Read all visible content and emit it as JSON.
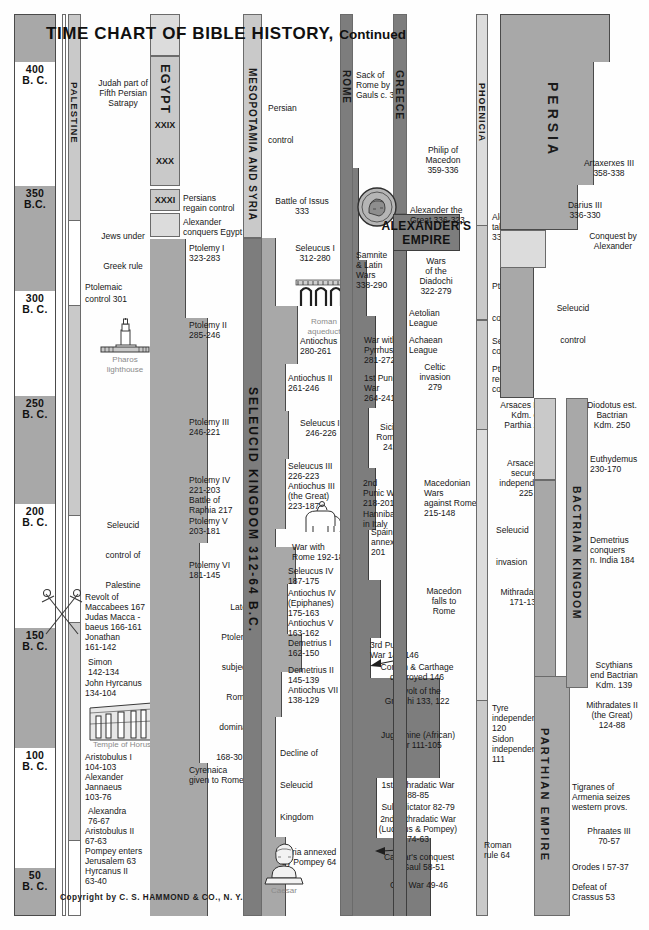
{
  "title": {
    "main": "TIME CHART OF BIBLE HISTORY,",
    "continued": "Continued"
  },
  "copyright": "Copyright by C. S. HAMMOND & CO., N. Y.",
  "date_scale": {
    "label": "B.C.",
    "ticks": [
      {
        "year": "400",
        "era": "B. C."
      },
      {
        "year": "350",
        "era": "B.C."
      },
      {
        "year": "300",
        "era": "B. C."
      },
      {
        "year": "250",
        "era": "B. C."
      },
      {
        "year": "200",
        "era": "B. C."
      },
      {
        "year": "150",
        "era": "B. C."
      },
      {
        "year": "100",
        "era": "B. C."
      },
      {
        "year": "50",
        "era": "B. C."
      }
    ]
  },
  "columns": {
    "palestine": {
      "header": "PALESTINE",
      "entries": [
        {
          "text": "Judah part of\nFifth Persian\nSatrapy"
        },
        {
          "text": "Jews under\n\nGreek rule"
        },
        {
          "text": "Ptolemaic\ncontrol 301"
        },
        {
          "text": "Seleucid\n\ncontrol of\n\nPalestine"
        },
        {
          "text": "Revolt of\nMaccabees 167"
        },
        {
          "text": "Judas Macca -\n   baeus 166-161"
        },
        {
          "text": "Jonathan\n   161-142"
        },
        {
          "text": "Simon\n142-134"
        },
        {
          "text": "John Hyrcanus\n134-104"
        },
        {
          "text": "Aristobulus I\n   104-103"
        },
        {
          "text": "Alexander\nJannaeus\n   103-76"
        },
        {
          "text": "Alexandra\n   76-67"
        },
        {
          "text": "Aristobulus II\n67-63"
        },
        {
          "text": "Pompey enters\nJerusalem 63"
        },
        {
          "text": "Hyrcanus II\n63-40"
        }
      ]
    },
    "egypt": {
      "header": "EGYPT",
      "dynasties": [
        "XXIX",
        "XXX",
        "XXXI"
      ],
      "entries": [
        {
          "text": "Persians\nregain control"
        },
        {
          "text": "Alexander\nconquers Egypt"
        },
        {
          "text": "Ptolemy I\n323-283"
        },
        {
          "text": "Ptolemy II\n285-246"
        },
        {
          "text": "Ptolemy III\n246-221"
        },
        {
          "text": "Ptolemy IV\n221-203\nBattle of\nRaphia 217"
        },
        {
          "text": "Ptolemy V\n203-181"
        },
        {
          "text": "Ptolemy VI\n181-145"
        },
        {
          "text": "Later\n\nPtolemies\n\nsubject to\n\nRoman\n\ndomination\n\n168-30 B. C."
        },
        {
          "text": "Cyrenaica\ngiven to Rome 96"
        }
      ]
    },
    "mesopotamia": {
      "header": "MESOPOTAMIA AND SYRIA",
      "kingdom_header": "SELEUCID KINGDOM 312-64 B.C.",
      "entries": [
        {
          "text": "Persian\n\ncontrol"
        },
        {
          "text": "Battle of Issus\n333"
        },
        {
          "text": "Seleucus I\n312-280"
        },
        {
          "text": "Antiochus I\n280-261"
        },
        {
          "text": "Antiochus II\n261-246"
        },
        {
          "text": "Seleucus II\n246-226"
        },
        {
          "text": "Seleucus III\n226-223"
        },
        {
          "text": "Antiochus III\n(the Great)\n   223-187"
        },
        {
          "text": "War with\nRome 192-189"
        },
        {
          "text": "Seleucus IV\n187-175"
        },
        {
          "text": "Antiochus IV\n(Epiphanes)\n175-163"
        },
        {
          "text": "Antiochus V\n163-162"
        },
        {
          "text": "Demetrius I\n162-150"
        },
        {
          "text": "Demetrius II\n145-139"
        },
        {
          "text": "Antiochus VII\n138-129"
        },
        {
          "text": "Decline of\n\nSeleucid\n\nKingdom"
        },
        {
          "text": "Syria annexed\nby Pompey 64"
        }
      ]
    },
    "rome": {
      "header": "ROME",
      "entries": [
        {
          "text": "Sack of\nRome by\nGauls c. 390"
        },
        {
          "text": "Samnite\n& Latin\nWars\n338-290"
        },
        {
          "text": "War with\nPyrrhus\n281-272"
        },
        {
          "text": "1st Punic\nWar\n264-241"
        },
        {
          "text": "Sicily\nRoman\n241"
        },
        {
          "text": "2nd\nPunic War\n218-201"
        },
        {
          "text": "Hannibal\nin Italy"
        },
        {
          "text": "Spain\nannexed\n201"
        },
        {
          "text": "3rd Punic\nWar 149-146"
        },
        {
          "text": "Corinth & Carthage\ndestroyed 146"
        },
        {
          "text": "Revolt of the\nGracchi 133, 122"
        },
        {
          "text": "Jugurthine (African)\nWar 111-105"
        },
        {
          "text": "1st Mithradatic War\n88-85"
        },
        {
          "text": "Sulla dictator 82-79"
        },
        {
          "text": "2nd Mithradatic War\n(Lucullus & Pompey)\n74-63"
        },
        {
          "text": "Caesar's conquest\nof Gaul 58-51"
        },
        {
          "text": "Civil War 49-46"
        }
      ]
    },
    "greece": {
      "header": "GREECE",
      "entries": [
        {
          "text": "Philip of\nMacedon\n359-336"
        },
        {
          "text": "Alexander the\nGreat 336-323"
        },
        {
          "text": "Wars\nof the\nDiadochi\n322-279"
        },
        {
          "text": "Aetolian\nLeague"
        },
        {
          "text": "Achaean\nLeague"
        },
        {
          "text": "Celtic\ninvasion\n279"
        },
        {
          "text": "Macedonian\nWars\nagainst Rome\n215-148"
        },
        {
          "text": "Macedon\nfalls to\nRome"
        }
      ]
    },
    "phoenicia": {
      "header": "PHOENICIA",
      "entries": [
        {
          "text": "Alexander\ntakes Tyre\n332"
        },
        {
          "text": "Ptolemaic\n\ncontrol"
        },
        {
          "text": "Seleucid\ncontrol"
        },
        {
          "text": "Ptolemy II\nregains\ncontrol 275"
        },
        {
          "text": "Arsaces I est.\nKdm. of\nParthia 248"
        },
        {
          "text": "Arsaces II\nsecures\nindependence\n225"
        },
        {
          "text": "Seleucid\n\ninvasion"
        },
        {
          "text": "Mithradates I\n171-138"
        },
        {
          "text": "Tyre\nindependent\n120"
        },
        {
          "text": "Sidon\nindependent\n111"
        },
        {
          "text": "Roman\nrule 64"
        }
      ]
    },
    "persia": {
      "header": "PERSIA",
      "parthian_header": "PARTHIAN EMPIRE",
      "bactrian_header": "BACTRIAN KINGDOM",
      "entries": [
        {
          "text": "Artaxerxes III\n358-338"
        },
        {
          "text": "Darius III\n336-330"
        },
        {
          "text": "Conquest by\nAlexander"
        },
        {
          "text": "Seleucid\n\ncontrol"
        },
        {
          "text": "Diodotus est.\nBactrian\nKdm. 250"
        },
        {
          "text": "Euthydemus\n230-170"
        },
        {
          "text": "Demetrius\nconquers\nn. India 184"
        },
        {
          "text": "Scythians\nend Bactrian\nKdm. 139"
        },
        {
          "text": "Mithradates II\n(the Great)\n124-88"
        },
        {
          "text": "Tigranes of\nArmenia seizes\nwestern provs."
        },
        {
          "text": "Phraates III\n70-57"
        },
        {
          "text": "Orodes I 57-37"
        },
        {
          "text": "Defeat of\nCrassus 53"
        }
      ]
    }
  },
  "empire_labels": {
    "alexander": "ALEXANDER'S\nEMPIRE"
  },
  "illustrations": [
    {
      "name": "pharos-lighthouse",
      "caption": "Pharos\nlighthouse"
    },
    {
      "name": "roman-aqueduct",
      "caption": "Roman\naqueduct"
    },
    {
      "name": "alexander-coin",
      "caption": ""
    },
    {
      "name": "elephant-rider",
      "caption": ""
    },
    {
      "name": "maccabean-swords",
      "caption": ""
    },
    {
      "name": "temple-of-horus",
      "caption": "Temple of Horus"
    },
    {
      "name": "caesar-bust",
      "caption": "Caesar"
    }
  ],
  "colors": {
    "dark": "#7d7d7d",
    "mid": "#a8a8a8",
    "light": "#c9c9c9",
    "pale": "#dcdcdc",
    "ink": "#171717",
    "caption": "#8a8a8a"
  }
}
